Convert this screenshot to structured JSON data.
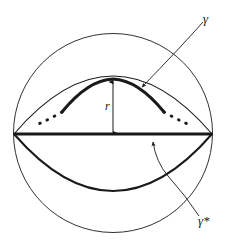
{
  "figure": {
    "type": "geometric-diagram",
    "background_color": "#ffffff",
    "stroke_color": "#1a1a1a",
    "labels": {
      "gamma": "γ",
      "gamma_star": "γ*",
      "radius": "r"
    },
    "elements": {
      "outer_circle": "sphere-outline",
      "upper_lens_arc": "upper-lens-arc",
      "lower_lens_arc": "lower-lens-arc",
      "equator": "equator-diameter",
      "gamma_curve": "gamma-bold-arc",
      "gamma_dots_left": "gamma-dotted-left",
      "gamma_dots_right": "gamma-dotted-right",
      "radius_arrow": "radius-double-arrow",
      "gamma_leader": "gamma-leader-arrow",
      "gamma_star_leader": "gamma-star-leader-arrow"
    },
    "geometry": {
      "circle_center_x": 113,
      "circle_center_y": 133,
      "circle_radius": 100,
      "equator_y": 134,
      "equator_left_x": 14,
      "equator_right_x": 212,
      "lens_top_y": 76,
      "lens_bottom_y": 190,
      "gamma_apex_y": 79
    }
  }
}
